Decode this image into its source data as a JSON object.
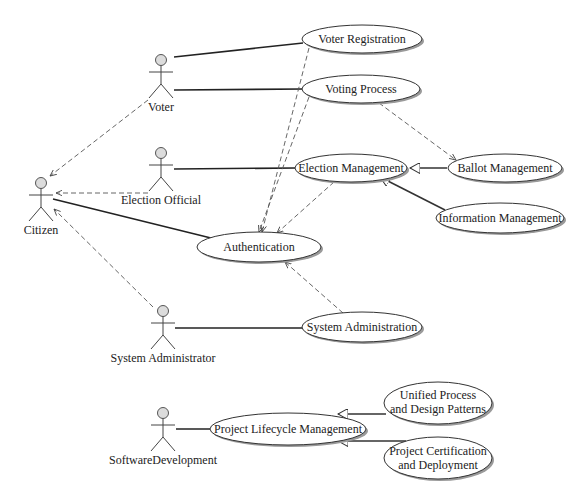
{
  "diagram": {
    "type": "uml-use-case",
    "actors": [
      {
        "id": "voter",
        "label": "Voter"
      },
      {
        "id": "election_official",
        "label": "Election Official"
      },
      {
        "id": "citizen",
        "label": "Citizen"
      },
      {
        "id": "system_administrator",
        "label": "System Administrator"
      },
      {
        "id": "software_development",
        "label": "SoftwareDevelopment"
      }
    ],
    "use_cases": [
      {
        "id": "voter_registration",
        "lines": [
          "Voter Registration"
        ]
      },
      {
        "id": "voting_process",
        "lines": [
          "Voting Process"
        ]
      },
      {
        "id": "election_management",
        "lines": [
          "Election Management"
        ]
      },
      {
        "id": "ballot_management",
        "lines": [
          "Ballot Management"
        ]
      },
      {
        "id": "information_management",
        "lines": [
          "Information Management"
        ]
      },
      {
        "id": "authentication",
        "lines": [
          "Authentication"
        ]
      },
      {
        "id": "system_administration",
        "lines": [
          "System Administration"
        ]
      },
      {
        "id": "project_lifecycle_management",
        "lines": [
          "Project Lifecycle Management"
        ]
      },
      {
        "id": "unified_process",
        "lines": [
          "Unified Process",
          "and Design Patterns"
        ]
      },
      {
        "id": "project_certification",
        "lines": [
          "Project Certification",
          "and Deployment"
        ]
      }
    ],
    "associations": [
      {
        "from": "voter",
        "to": "voter_registration"
      },
      {
        "from": "voter",
        "to": "voting_process"
      },
      {
        "from": "election_official",
        "to": "election_management"
      },
      {
        "from": "citizen",
        "to": "authentication"
      },
      {
        "from": "system_administrator",
        "to": "system_administration"
      },
      {
        "from": "software_development",
        "to": "project_lifecycle_management"
      }
    ],
    "dependencies": [
      {
        "from": "voter",
        "to": "citizen"
      },
      {
        "from": "election_official",
        "to": "citizen"
      },
      {
        "from": "system_administrator",
        "to": "citizen"
      },
      {
        "from": "voter_registration",
        "to": "authentication"
      },
      {
        "from": "voting_process",
        "to": "authentication"
      },
      {
        "from": "election_management",
        "to": "authentication"
      },
      {
        "from": "system_administration",
        "to": "authentication"
      },
      {
        "from": "voting_process",
        "to": "ballot_management"
      }
    ],
    "generalizations": [
      {
        "child": "ballot_management",
        "parent": "election_management"
      },
      {
        "child": "information_management",
        "parent": "election_management"
      },
      {
        "child": "unified_process",
        "parent": "project_lifecycle_management"
      },
      {
        "child": "project_certification",
        "parent": "project_lifecycle_management"
      }
    ]
  }
}
